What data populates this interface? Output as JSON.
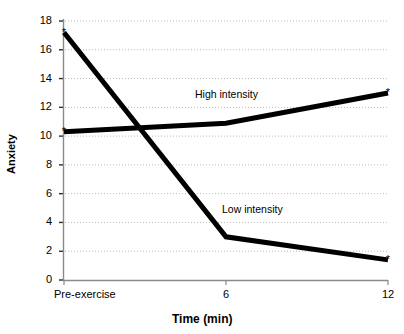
{
  "chart_data": {
    "type": "line",
    "title": "",
    "xlabel": "Time (min)",
    "ylabel": "Anxiety",
    "x": [
      0,
      6,
      12
    ],
    "xtick_labels": [
      "Pre-exercise",
      "6",
      "12"
    ],
    "ytick_labels": [
      "0",
      "2",
      "4",
      "6",
      "8",
      "10",
      "12",
      "14",
      "16",
      "18"
    ],
    "ytick_values": [
      0,
      2,
      4,
      6,
      8,
      10,
      12,
      14,
      16,
      18
    ],
    "ylim": [
      0,
      18
    ],
    "xlim": [
      0,
      12
    ],
    "grid": true,
    "grid_style": "dotted-horizontal",
    "legend_position": "inline-annotation",
    "line_color": "#000000",
    "series": [
      {
        "name": "High intensity",
        "label": "High intensity",
        "values": [
          10.3,
          10.9,
          13.0
        ],
        "marker": "asterisk-endpoints",
        "label_x": 195,
        "label_y": 88
      },
      {
        "name": "Low intensity",
        "label": "Low intensity",
        "values": [
          17.2,
          3.0,
          1.4
        ],
        "marker": "asterisk-endpoints",
        "label_x": 222,
        "label_y": 203
      }
    ]
  },
  "axes": {
    "y_title": "Anxiety",
    "x_title": "Time (min)"
  },
  "xticks": [
    {
      "label": "Pre-exercise",
      "value": 0
    },
    {
      "label": "6",
      "value": 6
    },
    {
      "label": "12",
      "value": 12
    }
  ],
  "yticks": [
    {
      "label": "18",
      "value": 18
    },
    {
      "label": "16",
      "value": 16
    },
    {
      "label": "14",
      "value": 14
    },
    {
      "label": "12",
      "value": 12
    },
    {
      "label": "10",
      "value": 10
    },
    {
      "label": "8",
      "value": 8
    },
    {
      "label": "6",
      "value": 6
    },
    {
      "label": "4",
      "value": 4
    },
    {
      "label": "2",
      "value": 2
    },
    {
      "label": "0",
      "value": 0
    }
  ],
  "caption": {
    "cropped_text": ""
  }
}
